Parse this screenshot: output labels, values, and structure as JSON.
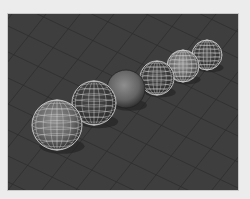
{
  "viewport": {
    "label": "3D perspective viewport",
    "background": "#3e3e3e",
    "grid_color": "#2e2e2e",
    "wire_color": "#d8d8d8"
  },
  "scene": {
    "objects": [
      {
        "name": "sphere-1",
        "cx": 49,
        "cy": 111,
        "r": 25,
        "shaded": true,
        "wireframe": true
      },
      {
        "name": "sphere-2",
        "cx": 86,
        "cy": 89,
        "r": 22,
        "shaded": false,
        "wireframe": true
      },
      {
        "name": "sphere-3",
        "cx": 118,
        "cy": 75,
        "r": 19,
        "shaded": true,
        "wireframe": false
      },
      {
        "name": "sphere-4",
        "cx": 149,
        "cy": 64,
        "r": 17,
        "shaded": false,
        "wireframe": true
      },
      {
        "name": "sphere-5",
        "cx": 175,
        "cy": 52,
        "r": 16,
        "shaded": true,
        "wireframe": true
      },
      {
        "name": "sphere-6",
        "cx": 199,
        "cy": 41,
        "r": 15,
        "shaded": false,
        "wireframe": true
      }
    ]
  }
}
